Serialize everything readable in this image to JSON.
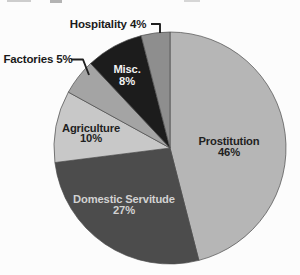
{
  "page": {
    "background": "#fcfcfc",
    "scan_artifacts": [
      {
        "x": 7,
        "y": 0,
        "w": 24,
        "h": 2,
        "color": "#cdcdcd"
      },
      {
        "x": 50,
        "y": 0,
        "w": 12,
        "h": 2.5,
        "color": "#b3b3b3"
      },
      {
        "x": 184,
        "y": 0,
        "w": 16,
        "h": 2,
        "color": "#d6d6d6"
      }
    ]
  },
  "chart_data": {
    "type": "pie",
    "title": "",
    "legend_position": "none",
    "grid": false,
    "layout": {
      "center_x": 170,
      "center_y": 148,
      "radius": 116,
      "start_angle_deg": 0,
      "direction": "clockwise",
      "slice_stroke": "#4a4a4a",
      "outside_label_font_px": 11.5,
      "inside_label_font_px": 11.2
    },
    "categories": [
      "Prostitution",
      "Domestic Servitude",
      "Agriculture",
      "Factories",
      "Misc.",
      "Hospitality"
    ],
    "values": [
      46,
      27,
      10,
      5,
      8,
      4
    ],
    "unit": "%",
    "segments": [
      {
        "label": "Prostitution",
        "value": 46,
        "color": "#b6b6b6",
        "placement": "inside",
        "label_color": "#1f1f1f",
        "label_lines": [
          "Prostitution",
          "46%"
        ],
        "label_x": 229,
        "label_y": 145,
        "line_gap": 10.5
      },
      {
        "label": "Domestic Servitude",
        "value": 27,
        "color": "#4c4c4c",
        "placement": "inside",
        "label_color": "#d2d2d2",
        "label_lines": [
          "Domestic Servitude",
          "27%"
        ],
        "label_x": 124,
        "label_y": 203,
        "line_gap": 10.5
      },
      {
        "label": "Agriculture",
        "value": 10,
        "color": "#c8c8c8",
        "placement": "inside",
        "label_color": "#1f1f1f",
        "label_lines": [
          "Agriculture",
          "10%"
        ],
        "label_x": 91,
        "label_y": 131.5,
        "line_gap": 10.5
      },
      {
        "label": "Factories",
        "value": 5,
        "color": "#a4a4a4",
        "placement": "outside",
        "label_color": "#1a1a1a",
        "label_lines": [
          "Factories 5%"
        ],
        "label_x": 38,
        "label_y": 63,
        "line_gap": 10.5,
        "leader": [
          [
            71,
            59.5
          ],
          [
            83,
            59.5
          ],
          [
            89,
            75
          ]
        ]
      },
      {
        "label": "Misc.",
        "value": 8,
        "color": "#1c1c1c",
        "placement": "inside",
        "label_color": "#f2f2f2",
        "label_lines": [
          "Misc.",
          "8%"
        ],
        "label_x": 127,
        "label_y": 73,
        "line_gap": 12
      },
      {
        "label": "Hospitality",
        "value": 4,
        "color": "#8e8e8e",
        "placement": "outside",
        "label_color": "#1a1a1a",
        "label_lines": [
          "Hospitality 4%"
        ],
        "label_x": 108,
        "label_y": 28,
        "line_gap": 10.5,
        "leader": [
          [
            151,
            24
          ],
          [
            160,
            24
          ],
          [
            160,
            33
          ]
        ]
      }
    ]
  }
}
